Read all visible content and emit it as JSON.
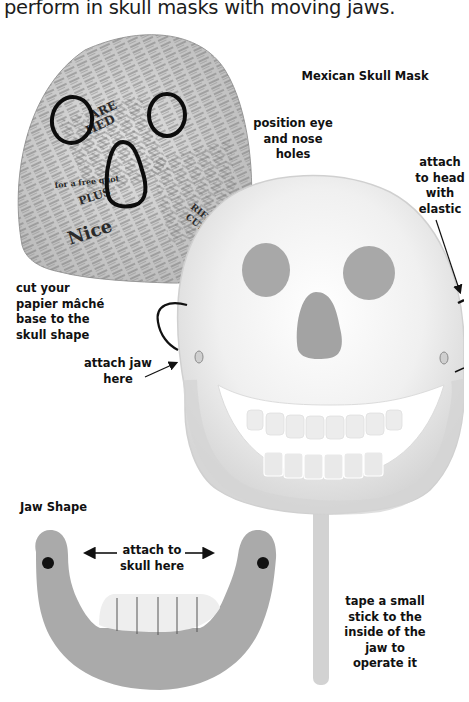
{
  "intro_text": "perform in skull masks with moving jaws.",
  "figures": {
    "papier_mache_base": {
      "newsprint_snippets": [
        "ARE",
        "HED",
        "RIFKIND",
        "CUTS",
        "FIN",
        "for a free quot",
        "PLUS",
        "Nice"
      ]
    },
    "mexican_skull_mask": {
      "title": "Mexican Skull Mask"
    },
    "jaw_shape": {
      "title": "Jaw Shape"
    }
  },
  "annotations": {
    "position_eye": [
      "position eye",
      "and nose",
      "holes"
    ],
    "attach_head": [
      "attach",
      "to head",
      "with",
      "elastic"
    ],
    "cut_base": [
      "cut your",
      "papier mâché",
      "base to the",
      "skull shape"
    ],
    "attach_jaw": [
      "attach jaw",
      "here"
    ],
    "attach_skull": [
      "attach to",
      "skull here"
    ],
    "tape_stick": [
      "tape a small",
      "stick to the",
      "inside of the",
      "jaw to",
      "operate it"
    ]
  },
  "colors": {
    "jaw_gray": "#a9a9a9",
    "mask_white": "#f2f2f2",
    "mask_shade": "#d9d9d9",
    "hole_gray": "#a6a6a6",
    "newsprint": "#c8c8c8",
    "ink": "#111111"
  }
}
